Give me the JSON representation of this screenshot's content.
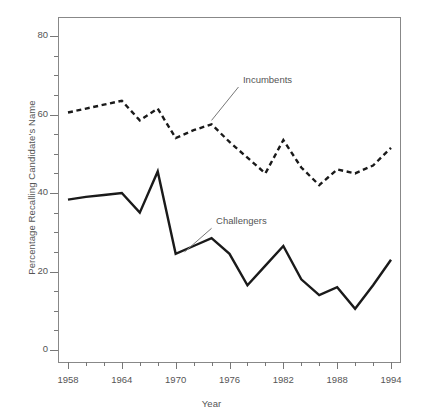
{
  "chart_data": {
    "type": "line",
    "title": "",
    "xlabel": "Year",
    "ylabel": "Percentage Recalling Candidate's Name",
    "xlim": [
      1957,
      1995
    ],
    "ylim": [
      0,
      84
    ],
    "grid": false,
    "legend_position": "inline-annotation",
    "x": [
      1958,
      1960,
      1962,
      1964,
      1966,
      1968,
      1970,
      1972,
      1974,
      1976,
      1978,
      1980,
      1982,
      1984,
      1986,
      1988,
      1990,
      1992,
      1994
    ],
    "x_tick_labels": [
      "1958",
      "",
      "",
      "1964",
      "",
      "",
      "1970",
      "",
      "",
      "1976",
      "",
      "",
      "1982",
      "",
      "",
      "1988",
      "",
      "",
      "1994"
    ],
    "x_major_ticks": [
      1958,
      1964,
      1970,
      1976,
      1982,
      1988,
      1994
    ],
    "x_minor_ticks": [
      1960,
      1962,
      1966,
      1968,
      1972,
      1974,
      1978,
      1980,
      1984,
      1986,
      1990,
      1992
    ],
    "y_major_ticks": [
      0,
      20,
      40,
      60,
      80
    ],
    "y_minor_ticks": [
      5,
      10,
      15,
      25,
      30,
      35,
      45,
      50,
      55,
      65,
      70,
      75
    ],
    "y_tick_labels": [
      "0",
      "20",
      "40",
      "60",
      "80"
    ],
    "series": [
      {
        "name": "Incumbents",
        "style": "dashed",
        "color": "#1a1a1a",
        "values": [
          60.5,
          61.5,
          62.5,
          63.5,
          58.5,
          61.5,
          54.0,
          56.0,
          57.5,
          53.0,
          49.0,
          45.0,
          53.5,
          46.5,
          42.0,
          46.0,
          45.0,
          47.0,
          51.5
        ],
        "label_x": 1977.5,
        "label_y": 68.5
      },
      {
        "name": "Challengers",
        "style": "solid",
        "color": "#1a1a1a",
        "values": [
          38.3,
          39.0,
          39.5,
          40.0,
          35.0,
          45.5,
          24.5,
          26.5,
          28.5,
          24.5,
          16.5,
          21.5,
          26.5,
          18.0,
          14.0,
          16.0,
          10.5,
          16.5,
          23.0
        ],
        "label_x": 1974.5,
        "label_y": 32.5
      }
    ],
    "annotations": [
      {
        "text": "Incumbents",
        "leader_from": [
          1977.0,
          67.0
        ],
        "leader_to": [
          1974.0,
          58.5
        ]
      },
      {
        "text": "Challengers",
        "leader_from": [
          1974.0,
          31.0
        ],
        "leader_to": [
          1971.0,
          25.0
        ]
      }
    ]
  },
  "axes": {
    "y_title": "Percentage Recalling Candidate's Name",
    "x_title": "Year"
  },
  "colors": {
    "line": "#1a1a1a",
    "frame": "#888888",
    "tick": "#777777",
    "text": "#555555",
    "background": "#ffffff"
  }
}
